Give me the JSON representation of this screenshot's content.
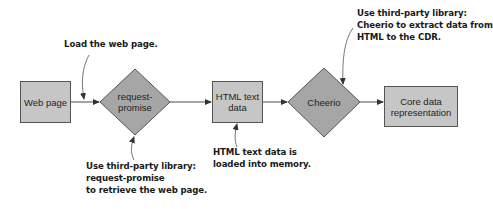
{
  "diagram": {
    "type": "flowchart",
    "colors": {
      "box_fill": "#c6c6c6",
      "diamond_fill": "#a6a6a6",
      "stroke": "#555555",
      "arrow": "#333333",
      "text": "#1f1f1f"
    },
    "nodes": [
      {
        "id": "web-page",
        "shape": "rectangle",
        "label": "Web page"
      },
      {
        "id": "request-promise",
        "shape": "diamond",
        "label_lines": [
          "request-",
          "promise"
        ]
      },
      {
        "id": "html-text-data",
        "shape": "rectangle",
        "label_lines": [
          "HTML text",
          "data"
        ]
      },
      {
        "id": "cheerio",
        "shape": "diamond",
        "label": "Cheerio"
      },
      {
        "id": "core-data-representation",
        "shape": "rectangle",
        "label_lines": [
          "Core data",
          "representation"
        ]
      }
    ],
    "edges": [
      {
        "from": "web-page",
        "to": "request-promise"
      },
      {
        "from": "request-promise",
        "to": "html-text-data"
      },
      {
        "from": "html-text-data",
        "to": "cheerio"
      },
      {
        "from": "cheerio",
        "to": "core-data-representation"
      }
    ],
    "annotations": [
      {
        "id": "load-web-page",
        "target": "web-page-to-request-promise-edge",
        "lines": [
          "Load the web page."
        ]
      },
      {
        "id": "request-promise-note",
        "target": "request-promise",
        "lines": [
          "Use third-party library:",
          "request-promise",
          "to retrieve the web page."
        ]
      },
      {
        "id": "html-text-note",
        "target": "html-text-data",
        "lines": [
          "HTML text data is",
          "loaded into memory."
        ]
      },
      {
        "id": "cheerio-note",
        "target": "cheerio",
        "lines": [
          "Use third-party library:",
          "Cheerio to extract data from",
          "HTML to the CDR."
        ]
      }
    ]
  }
}
